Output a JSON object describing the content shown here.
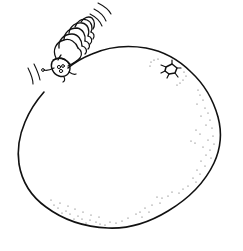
{
  "illustration": {
    "description": "Line drawing of a caterpillar crawling on top of a large round fruit (orange)",
    "subjects": [
      {
        "name": "caterpillar",
        "icon": "caterpillar-icon"
      },
      {
        "name": "orange",
        "icon": "orange-icon"
      }
    ],
    "colors": {
      "ink": "#111111",
      "stipple": "#555555",
      "background": "#ffffff"
    }
  }
}
